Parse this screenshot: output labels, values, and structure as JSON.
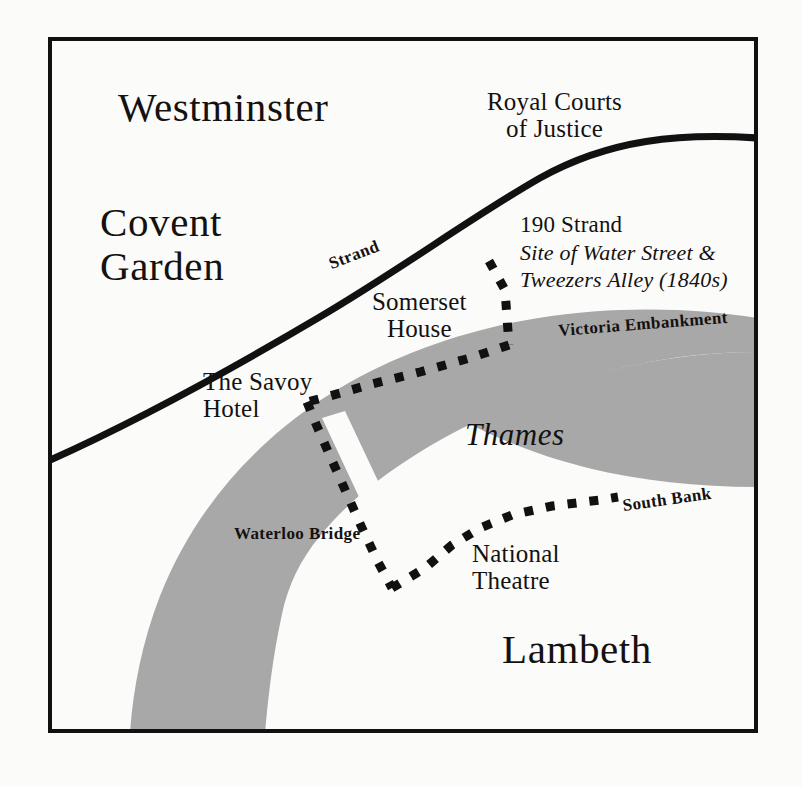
{
  "map": {
    "title": "Strand and South Bank area of London",
    "colors": {
      "background": "#fbfbfa",
      "frame": "#111111",
      "river_fill": "#a8a8a8",
      "road": "#111111",
      "route_dots": "#111111",
      "text": "#14110f"
    },
    "frame": {
      "x": 48,
      "y": 37,
      "width": 710,
      "height": 696,
      "stroke_width": 4
    },
    "districts": [
      {
        "name": "westminster",
        "label": "Westminster",
        "x": 118,
        "y": 85
      },
      {
        "name": "covent-garden",
        "label": "Covent\nGarden",
        "x": 100,
        "y": 200
      },
      {
        "name": "lambeth",
        "label": "Lambeth",
        "x": 502,
        "y": 627
      }
    ],
    "places": [
      {
        "name": "royal-courts-of-justice",
        "label": "Royal Courts\nof Justice",
        "x": 487,
        "y": 88
      },
      {
        "name": "somerset-house",
        "label": "Somerset\nHouse",
        "x": 372,
        "y": 288
      },
      {
        "name": "the-savoy-hotel",
        "label": "The Savoy\nHotel",
        "x": 203,
        "y": 368
      },
      {
        "name": "national-theatre",
        "label": "National\nTheatre",
        "x": 472,
        "y": 540
      }
    ],
    "annotation": {
      "name": "190-strand-annotation",
      "title": "190 Strand",
      "subtitle": "Site of Water Street &\nTweezers Alley (1840s)",
      "x": 520,
      "y": 213
    },
    "roads": [
      {
        "name": "strand",
        "label": "Strand",
        "x": 333,
        "y": 255,
        "rotation": -21
      },
      {
        "name": "victoria-embankment",
        "label": "Victoria Embankment",
        "x": 559,
        "y": 322,
        "rotation": -4.5
      },
      {
        "name": "south-bank",
        "label": "South Bank",
        "x": 624,
        "y": 497,
        "rotation": -8
      },
      {
        "name": "waterloo-bridge",
        "label": "Waterloo Bridge",
        "x": 234,
        "y": 525,
        "rotation": 0
      }
    ],
    "water": [
      {
        "name": "thames",
        "label": "Thames",
        "x": 465,
        "y": 418
      }
    ],
    "legend_note": "Dotted line marks the walking route along the Embankment, over Waterloo Bridge and along the South Bank."
  }
}
